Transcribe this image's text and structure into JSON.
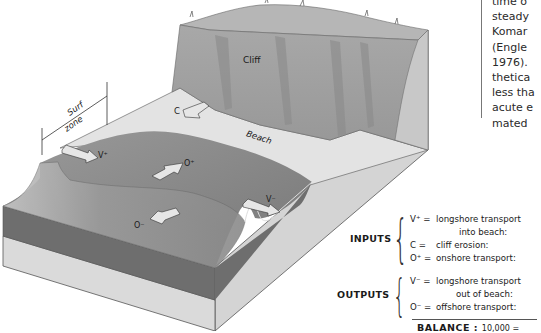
{
  "diagram": {
    "labels": {
      "cliff": "Cliff",
      "beach": "Beach",
      "surf_zone_line1": "Surf",
      "surf_zone_line2": "zone",
      "arrow_c": "C",
      "arrow_v_plus": "V⁺",
      "arrow_o_plus": "O⁺",
      "arrow_o_minus": "O⁻",
      "arrow_v_minus": "V⁻"
    },
    "colors": {
      "cliff_face": "#9c9c9c",
      "cliff_top": "#b4b4b4",
      "beach": "#e2e2e2",
      "sea_surface": "#8a8a8a",
      "block_side_light": "#d6d6d6",
      "block_side_dark": "#6f6f6f",
      "arrow_fill": "#e6e6e6"
    }
  },
  "sidebar_text": {
    "lines": [
      "time o",
      "steady",
      "Komar",
      "(Engle",
      "1976).",
      "thetica",
      "less tha",
      "acute e",
      "mated"
    ]
  },
  "legend": {
    "inputs": {
      "label": "INPUTS",
      "items": [
        {
          "symbol": "V⁺ =",
          "text": "longshore transport",
          "text2": "into beach:"
        },
        {
          "symbol": "C  =",
          "text": "cliff erosion:"
        },
        {
          "symbol": "O⁺ =",
          "text": "onshore transport:"
        }
      ]
    },
    "outputs": {
      "label": "OUTPUTS",
      "items": [
        {
          "symbol": "V⁻ =",
          "text": "longshore transport",
          "text2": "out of beach:"
        },
        {
          "symbol": "O⁻ =",
          "text": "offshore transport:"
        }
      ]
    },
    "balance": {
      "label": "BALANCE :",
      "value": "10,000 ="
    }
  }
}
